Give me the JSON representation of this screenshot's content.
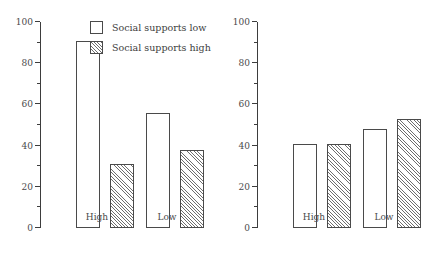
{
  "chart_data": [
    {
      "type": "bar",
      "panel": "left",
      "title": "",
      "xlabel": "",
      "ylabel": "",
      "categories": [
        "High",
        "Low"
      ],
      "series": [
        {
          "name": "Social supports low",
          "values": [
            91,
            56
          ],
          "fill": "open"
        },
        {
          "name": "Social supports high",
          "values": [
            31,
            38
          ],
          "fill": "hatched"
        }
      ],
      "ylim": [
        0,
        100
      ],
      "yticks": [
        0,
        20,
        40,
        60,
        80,
        100
      ],
      "yticklabels": [
        "0",
        "20",
        "40",
        "60",
        "80",
        "100"
      ],
      "yminorticks": [
        10,
        30,
        50,
        70,
        90
      ],
      "grid": false,
      "legend_position": "upper right"
    },
    {
      "type": "bar",
      "panel": "right",
      "title": "",
      "xlabel": "",
      "ylabel": "",
      "categories": [
        "High",
        "Low"
      ],
      "series": [
        {
          "name": "Social supports low",
          "values": [
            41,
            48
          ],
          "fill": "open"
        },
        {
          "name": "Social supports high",
          "values": [
            41,
            53
          ],
          "fill": "hatched"
        }
      ],
      "ylim": [
        0,
        100
      ],
      "yticks": [
        0,
        20,
        40,
        60,
        80,
        100
      ],
      "yticklabels": [
        "0",
        "20",
        "40",
        "60",
        "80",
        "100"
      ],
      "yminorticks": [
        10,
        30,
        50,
        70,
        90
      ],
      "grid": false,
      "legend_position": "none"
    }
  ],
  "legend": {
    "entries": [
      {
        "label": "Social supports low",
        "swatch": "open-square"
      },
      {
        "label": "Social supports high",
        "swatch": "hatched-square"
      }
    ]
  },
  "colors": {
    "axis": "#3d3d3d",
    "bar_outline": "#4a4a4a",
    "bar_open_fill": "#ffffff",
    "hatch_line": "#6e6e6e",
    "background": "#ffffff",
    "text": "#3d3d3d"
  }
}
